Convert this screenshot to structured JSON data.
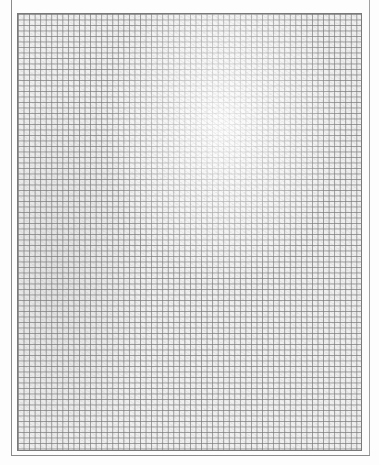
{
  "document": {
    "type": "graph-paper-scan",
    "description": "Scanned sheet of blank square-ruled graph paper",
    "grid": {
      "columns": 62,
      "rows": 80,
      "line_color": "#7a7a7a",
      "paper_color": "#efefef"
    },
    "text": ""
  }
}
